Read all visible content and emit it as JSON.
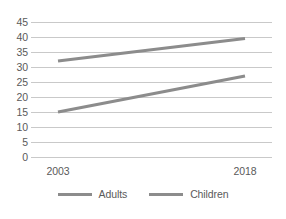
{
  "chart_data": {
    "type": "line",
    "title": "",
    "xlabel": "",
    "ylabel": "",
    "x": [
      "2003",
      "2018"
    ],
    "categories": [
      "2003",
      "2018"
    ],
    "series": [
      {
        "name": "Adults",
        "values": [
          32,
          39.5
        ],
        "color": "#8c8c8c"
      },
      {
        "name": "Children",
        "values": [
          15,
          27
        ],
        "color": "#8c8c8c"
      }
    ],
    "ylim": [
      0,
      45
    ],
    "yticks": [
      0,
      5,
      10,
      15,
      20,
      25,
      30,
      35,
      40,
      45
    ],
    "ytick_labels": [
      "0",
      "5",
      "10",
      "15",
      "20",
      "25",
      "30",
      "35",
      "40",
      "45"
    ],
    "xtick_labels": [
      "2003",
      "2018"
    ],
    "grid": true,
    "grid_color": "#c9c9c9",
    "legend_position": "bottom",
    "background": "#ffffff"
  },
  "legend": {
    "entries": [
      {
        "label": "Adults"
      },
      {
        "label": "Children"
      }
    ]
  }
}
